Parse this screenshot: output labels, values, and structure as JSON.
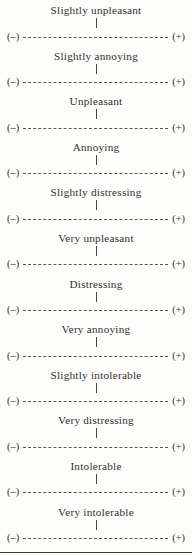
{
  "page": {
    "kind": "rating-scale-sheet",
    "anchor_left": "(–)",
    "anchor_right": "(+)",
    "ink_color": "#332f2c",
    "paper_color": "#fdfdfc",
    "rule_color": "#3a3734"
  },
  "scales": [
    {
      "label": "Slightly unpleasant"
    },
    {
      "label": "Slightly annoying"
    },
    {
      "label": "Unpleasant"
    },
    {
      "label": "Annoying"
    },
    {
      "label": "Slightly distressing"
    },
    {
      "label": "Very unpleasant"
    },
    {
      "label": "Distressing"
    },
    {
      "label": "Very annoying"
    },
    {
      "label": "Slightly intolerable"
    },
    {
      "label": "Very distressing"
    },
    {
      "label": "Intolerable"
    },
    {
      "label": "Very intolerable"
    }
  ]
}
